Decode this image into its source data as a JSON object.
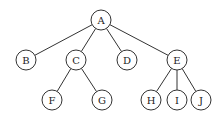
{
  "diagram": {
    "type": "tree",
    "nodes": [
      {
        "id": "A",
        "label": "A"
      },
      {
        "id": "B",
        "label": "B"
      },
      {
        "id": "C",
        "label": "C"
      },
      {
        "id": "D",
        "label": "D"
      },
      {
        "id": "E",
        "label": "E"
      },
      {
        "id": "F",
        "label": "F"
      },
      {
        "id": "G",
        "label": "G"
      },
      {
        "id": "H",
        "label": "H"
      },
      {
        "id": "I",
        "label": "I"
      },
      {
        "id": "J",
        "label": "J"
      }
    ],
    "edges": [
      {
        "from": "A",
        "to": "B"
      },
      {
        "from": "A",
        "to": "C"
      },
      {
        "from": "A",
        "to": "D"
      },
      {
        "from": "A",
        "to": "E"
      },
      {
        "from": "C",
        "to": "F"
      },
      {
        "from": "C",
        "to": "G"
      },
      {
        "from": "E",
        "to": "H"
      },
      {
        "from": "E",
        "to": "I"
      },
      {
        "from": "E",
        "to": "J"
      }
    ]
  }
}
